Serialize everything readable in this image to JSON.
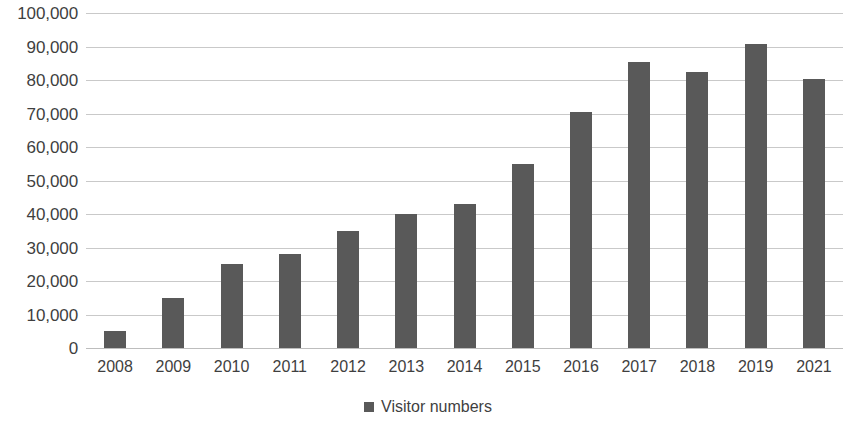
{
  "chart_data": {
    "type": "bar",
    "title": "",
    "subtitle": "",
    "xlabel": "",
    "ylabel": "",
    "categories": [
      "2008",
      "2009",
      "2010",
      "2011",
      "2012",
      "2013",
      "2014",
      "2015",
      "2016",
      "2017",
      "2018",
      "2019",
      "2021"
    ],
    "series": [
      {
        "name": "Visitor numbers",
        "color": "#595959",
        "values": [
          5000,
          15000,
          25000,
          28000,
          35000,
          40000,
          43000,
          55000,
          70500,
          85500,
          82500,
          90700,
          80300
        ]
      }
    ],
    "ylim": [
      0,
      100000
    ],
    "ytick_step": 10000,
    "ytick_labels": [
      "100,000",
      "90,000",
      "80,000",
      "70,000",
      "60,000",
      "50,000",
      "40,000",
      "30,000",
      "20,000",
      "10,000",
      "0"
    ],
    "ytick_values": [
      100000,
      90000,
      80000,
      70000,
      60000,
      50000,
      40000,
      30000,
      20000,
      10000,
      0
    ],
    "grid": true,
    "grid_axis": "y",
    "grid_color": "#c9c9c9",
    "legend_position": "bottom",
    "legend": [
      {
        "label": "Visitor numbers",
        "marker": "square-marker",
        "color": "#595959"
      }
    ]
  }
}
